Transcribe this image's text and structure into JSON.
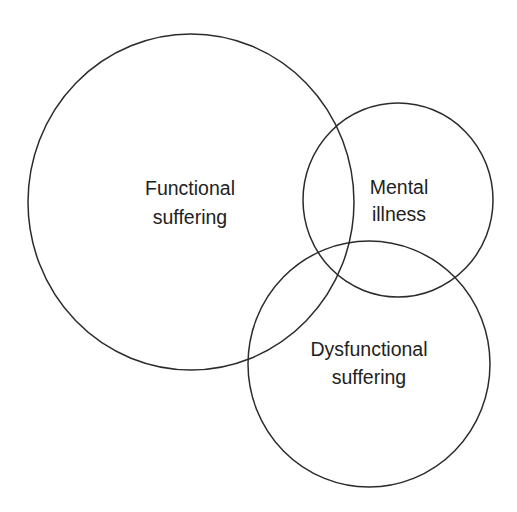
{
  "diagram": {
    "type": "venn",
    "background": "#ffffff",
    "stroke_color": "#2b2b2b",
    "text_color": "#222222",
    "sets": [
      {
        "id": "functional-suffering",
        "label_lines": [
          "Functional",
          "suffering"
        ],
        "shape": {
          "cx": 191,
          "cy": 202,
          "rx": 163,
          "ry": 168
        }
      },
      {
        "id": "mental-illness",
        "label_lines": [
          "Mental",
          "illness"
        ],
        "shape": {
          "cx": 398,
          "cy": 200,
          "rx": 95,
          "ry": 97
        }
      },
      {
        "id": "dysfunctional-suffering",
        "label_lines": [
          "Dysfunctional",
          "suffering"
        ],
        "shape": {
          "cx": 369,
          "cy": 364,
          "rx": 121,
          "ry": 123
        }
      }
    ]
  }
}
